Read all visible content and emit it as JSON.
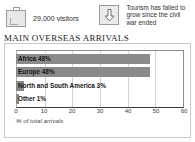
{
  "facts": [
    {
      "icon": "suitcase-icon",
      "text": "29,000 visitors"
    },
    {
      "icon": "down-arrow-icon",
      "text": "Tourism has failed to grow since the civil war ended"
    }
  ],
  "section": {
    "title": "MAIN OVERSEAS ARRIVALS"
  },
  "chart_data": {
    "type": "bar",
    "orientation": "horizontal",
    "title": "MAIN OVERSEAS ARRIVALS",
    "xlabel": "% of total arrivals",
    "ylabel": "",
    "xlim": [
      0,
      60
    ],
    "xticks": [
      0,
      10,
      20,
      30,
      40,
      50,
      60
    ],
    "grid": true,
    "legend": false,
    "bar_color": "#8a8a8a",
    "categories": [
      "Africa",
      "Europe",
      "North and South America",
      "Other"
    ],
    "values": [
      48,
      48,
      3,
      1
    ],
    "bar_labels": [
      "Africa 48%",
      "Europe 48%",
      "North and South America 3%",
      "Other 1%"
    ]
  }
}
